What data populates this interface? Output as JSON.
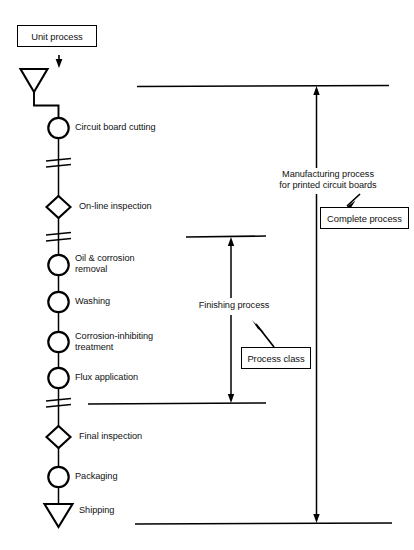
{
  "diagram": {
    "title_box": {
      "label": "Unit process"
    },
    "flow_nodes": [
      {
        "id": "start",
        "shape": "triangle-down",
        "label": ""
      },
      {
        "id": "circuit-board-cutting",
        "shape": "circle",
        "label": "Circuit board cutting"
      },
      {
        "id": "on-line-inspection",
        "shape": "diamond",
        "label": "On-line inspection"
      },
      {
        "id": "oil-corrosion-removal",
        "shape": "circle",
        "label": "Oil & corrosion\nremoval"
      },
      {
        "id": "washing",
        "shape": "circle",
        "label": "Washing"
      },
      {
        "id": "corrosion-inhibiting-treatment",
        "shape": "circle",
        "label": "Corrosion-inhibiting\ntreatment"
      },
      {
        "id": "flux-application",
        "shape": "circle",
        "label": "Flux application"
      },
      {
        "id": "final-inspection",
        "shape": "diamond",
        "label": "Final inspection"
      },
      {
        "id": "packaging",
        "shape": "circle",
        "label": "Packaging"
      },
      {
        "id": "shipping",
        "shape": "triangle-down",
        "label": "Shipping"
      }
    ],
    "brackets": [
      {
        "id": "finishing-process",
        "label": "Finishing process",
        "callout": "Process class"
      },
      {
        "id": "manufacturing-process",
        "label": "Manufacturing process\nfor printed circuit boards",
        "callout": "Complete process"
      }
    ],
    "colors": {
      "ink": "#000000",
      "text": "#111111",
      "background": "#ffffff"
    }
  }
}
